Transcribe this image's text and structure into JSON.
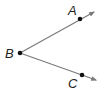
{
  "diagram": {
    "type": "angle",
    "vertex": {
      "label": "B",
      "x": 20,
      "y": 53
    },
    "rays": [
      {
        "name": "ray-BA",
        "point": {
          "label": "A",
          "x": 80,
          "y": 19
        },
        "end": {
          "x": 94,
          "y": 12
        }
      },
      {
        "name": "ray-BC",
        "point": {
          "label": "C",
          "x": 82,
          "y": 75
        },
        "end": {
          "x": 96,
          "y": 80
        }
      }
    ],
    "colors": {
      "line": "#7a7a7a",
      "point": "#111111",
      "label": "#222222"
    }
  }
}
